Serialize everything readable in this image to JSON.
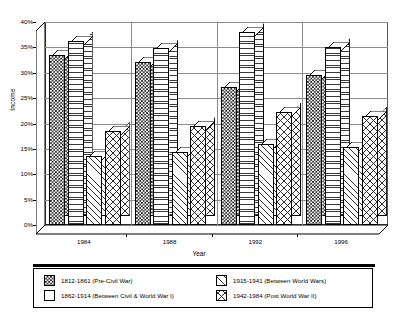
{
  "chart_data": {
    "type": "bar",
    "title": "",
    "xlabel": "Year",
    "ylabel": "Income",
    "categories": [
      "1984",
      "1988",
      "1992",
      "1996"
    ],
    "ylim": [
      0,
      40
    ],
    "ytick_labels": [
      "0%",
      "5%",
      "10%",
      "15%",
      "20%",
      "25%",
      "30%",
      "35%",
      "40%"
    ],
    "ytick_values": [
      0,
      5,
      10,
      15,
      20,
      25,
      30,
      35,
      40
    ],
    "grid": true,
    "legend_position": "bottom",
    "style": "3d-grouped-bar",
    "series": [
      {
        "name": "1812-1861 (Pre-Civil War)",
        "pattern": "checkerboard",
        "values": [
          33.5,
          32.2,
          27.2,
          29.5
        ]
      },
      {
        "name": "1862-1914 (Between Civil & World War I)",
        "pattern": "horizontal-lines",
        "values": [
          36.3,
          34.8,
          38.0,
          35.0
        ]
      },
      {
        "name": "1915-1941 (Between World Wars)",
        "pattern": "diagonal-lines",
        "values": [
          13.5,
          14.3,
          16.0,
          15.3
        ]
      },
      {
        "name": "1942-1984 (Post World War II)",
        "pattern": "cross-hatch",
        "values": [
          18.5,
          19.5,
          22.3,
          21.5
        ]
      }
    ]
  },
  "legend": {
    "items": [
      {
        "label": "1812-1861 (Pre-Civil War)",
        "pattern": "checkerboard"
      },
      {
        "label": "1862-1914 (Between Civil & World War I)",
        "pattern": "plain"
      },
      {
        "label": "1915-1941 (Between World Wars)",
        "pattern": "diagonal-lines"
      },
      {
        "label": "1942-1984 (Post World War II)",
        "pattern": "cross-hatch"
      }
    ]
  }
}
